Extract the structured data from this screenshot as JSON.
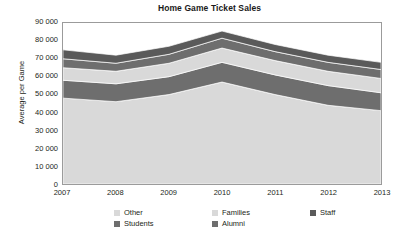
{
  "chart_data": {
    "type": "area",
    "stacked": true,
    "title": "Home Game Ticket Sales",
    "xlabel": "",
    "ylabel": "Average per Game",
    "categories": [
      "2007",
      "2008",
      "2009",
      "2010",
      "2011",
      "2012",
      "2013"
    ],
    "x": [
      2007,
      2008,
      2009,
      2010,
      2011,
      2012,
      2013
    ],
    "ylim": [
      0,
      90000
    ],
    "ytick_labels": [
      "0",
      "10 000",
      "20 000",
      "30 000",
      "40 000",
      "50 000",
      "60 000",
      "70 000",
      "80 000",
      "90 000"
    ],
    "ytick_values": [
      0,
      10000,
      20000,
      30000,
      40000,
      50000,
      60000,
      70000,
      80000,
      90000
    ],
    "grid": false,
    "legend_position": "bottom",
    "series": [
      {
        "name": "Other",
        "color": "#d9d9d9",
        "values": [
          48000,
          46000,
          50000,
          57000,
          50000,
          44000,
          41000
        ]
      },
      {
        "name": "Students",
        "color": "#6e6e6e",
        "values": [
          10000,
          10000,
          10000,
          11000,
          11000,
          11000,
          10000
        ]
      },
      {
        "name": "Families",
        "color": "#d9d9d9",
        "values": [
          7000,
          7000,
          7500,
          8000,
          8000,
          8000,
          8000
        ]
      },
      {
        "name": "Alumni",
        "color": "#6e6e6e",
        "values": [
          5000,
          4500,
          5000,
          5500,
          5000,
          5000,
          5000
        ]
      },
      {
        "name": "Staff",
        "color": "#5a5a5a",
        "values": [
          5000,
          4500,
          4500,
          4000,
          4000,
          4000,
          4000
        ]
      }
    ],
    "stack_totals": [
      75000,
      72000,
      77000,
      85500,
      78000,
      72000,
      68000
    ]
  },
  "legend": {
    "items": [
      {
        "label": "Other",
        "color": "#d9d9d9"
      },
      {
        "label": "Families",
        "color": "#d9d9d9"
      },
      {
        "label": "Staff",
        "color": "#5a5a5a"
      },
      {
        "label": "Students",
        "color": "#6e6e6e"
      },
      {
        "label": "Alumni",
        "color": "#6e6e6e"
      }
    ]
  }
}
